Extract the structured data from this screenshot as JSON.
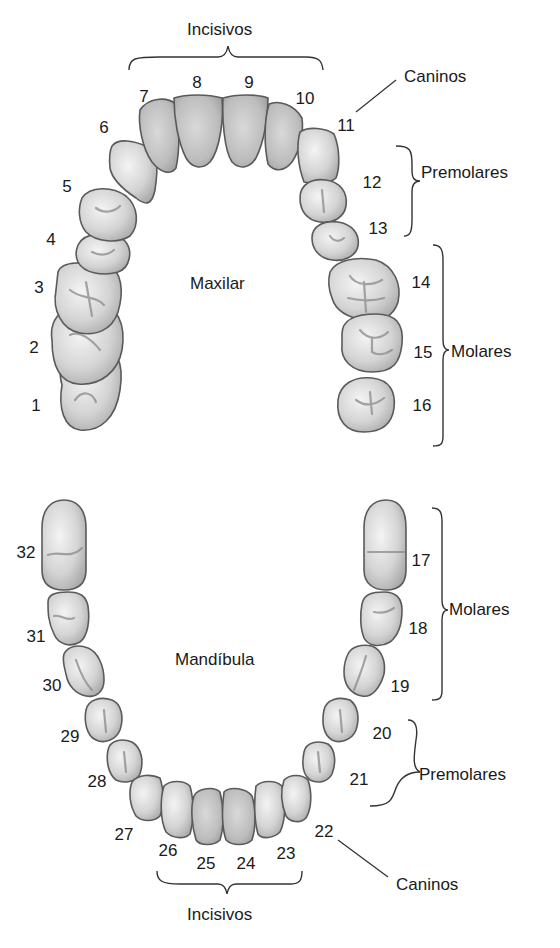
{
  "diagram": {
    "upper_arch": {
      "title": "Maxilar",
      "groups": {
        "incisors": "Incisivos",
        "canines": "Caninos",
        "premolars": "Premolares",
        "molars": "Molares"
      },
      "tooth_numbers": [
        "1",
        "2",
        "3",
        "4",
        "5",
        "6",
        "7",
        "8",
        "9",
        "10",
        "11",
        "12",
        "13",
        "14",
        "15",
        "16"
      ]
    },
    "lower_arch": {
      "title": "Mandíbula",
      "groups": {
        "incisors": "Incisivos",
        "canines": "Caninos",
        "premolars": "Premolares",
        "molars": "Molares"
      },
      "tooth_numbers": [
        "17",
        "18",
        "19",
        "20",
        "21",
        "22",
        "23",
        "24",
        "25",
        "26",
        "27",
        "28",
        "29",
        "30",
        "31",
        "32"
      ]
    }
  },
  "colors": {
    "enamel_light": "#f2f2f2",
    "enamel_mid": "#c9c9c9",
    "enamel_dark": "#a8a8a8",
    "outline": "#5a5a5a",
    "text": "#1a1a1a"
  }
}
